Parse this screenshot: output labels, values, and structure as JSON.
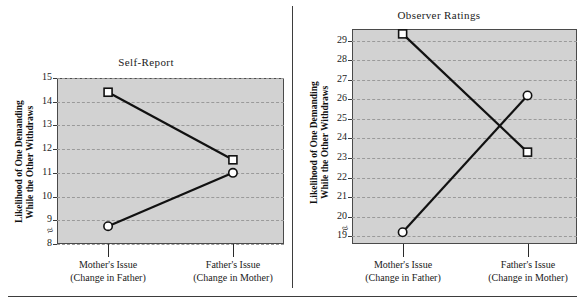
{
  "figure": {
    "background_color": "#ffffff",
    "plot_background_color": "#d2d2d2",
    "line_color": "#111111",
    "gridline_color": "#9a9a9a",
    "axis_break_glyph": "≈"
  },
  "panels": [
    {
      "key": "self_report",
      "title": "Self-Report",
      "ylabel_line1": "Likelihood of One Demanding",
      "ylabel_line2": "While the Other Withdraws",
      "ytick_labels": [
        "15",
        "14",
        "13",
        "12",
        "11",
        "10",
        "9",
        "8"
      ],
      "xtick_labels": [
        {
          "line1": "Mother's Issue",
          "line2": "(Change in Father)"
        },
        {
          "line1": "Father's Issue",
          "line2": "(Change in Mother)"
        }
      ]
    },
    {
      "key": "observer_ratings",
      "title": "Observer Ratings",
      "ylabel_line1": "Likelihood of One Demanding",
      "ylabel_line2": "While the Other Withdraws",
      "ytick_labels": [
        "29",
        "28",
        "27",
        "26",
        "25",
        "24",
        "23",
        "22",
        "21",
        "20",
        "19"
      ],
      "xtick_labels": [
        {
          "line1": "Mother's Issue",
          "line2": "(Change in Father)"
        },
        {
          "line1": "Father's Issue",
          "line2": "(Change in Mother)"
        }
      ]
    }
  ],
  "chart_data": [
    {
      "type": "line",
      "title": "Self-Report",
      "xlabel": "",
      "ylabel": "Likelihood of One Demanding While the Other Withdraws",
      "categories": [
        "Mother's Issue (Change in Father)",
        "Father's Issue (Change in Mother)"
      ],
      "ylim": [
        8,
        15
      ],
      "yticks": [
        8,
        9,
        10,
        11,
        12,
        13,
        14,
        15
      ],
      "grid": true,
      "legend": "none",
      "axis_break": true,
      "series": [
        {
          "name": "square-series",
          "marker": "square",
          "values": [
            14.4,
            11.55
          ]
        },
        {
          "name": "circle-series",
          "marker": "circle",
          "values": [
            8.75,
            11.0
          ]
        }
      ]
    },
    {
      "type": "line",
      "title": "Observer Ratings",
      "xlabel": "",
      "ylabel": "Likelihood of One Demanding While the Other Withdraws",
      "categories": [
        "Mother's Issue (Change in Father)",
        "Father's Issue (Change in Mother)"
      ],
      "ylim": [
        18.6,
        29.6
      ],
      "yticks": [
        19,
        20,
        21,
        22,
        23,
        24,
        25,
        26,
        27,
        28,
        29
      ],
      "grid": true,
      "legend": "none",
      "axis_break": true,
      "series": [
        {
          "name": "square-series",
          "marker": "square",
          "values": [
            29.35,
            23.3
          ]
        },
        {
          "name": "circle-series",
          "marker": "circle",
          "values": [
            19.2,
            26.2
          ]
        }
      ]
    }
  ]
}
